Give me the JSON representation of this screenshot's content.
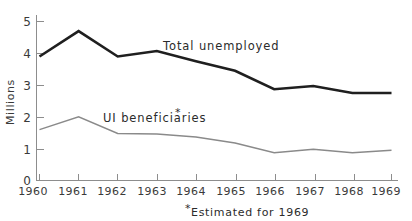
{
  "chart_data": {
    "type": "line",
    "title": "",
    "xlabel": "",
    "ylabel": "Millions",
    "categories": [
      "1960",
      "1961",
      "1962",
      "1963",
      "1964",
      "1965",
      "1966",
      "1967",
      "1968",
      "1969"
    ],
    "x": [
      1960,
      1961,
      1962,
      1963,
      1964,
      1965,
      1966,
      1967,
      1968,
      1969
    ],
    "xlim": [
      1960,
      1969
    ],
    "ylim": [
      0,
      5
    ],
    "yticks": [
      0,
      1,
      2,
      3,
      4,
      5
    ],
    "ytick_labels": [
      "0",
      "1",
      "2",
      "3",
      "4",
      "5"
    ],
    "grid": false,
    "legend_position": "inline-annotation",
    "series": [
      {
        "name": "Total unemployed",
        "color": "#1f1f1f",
        "line_width": 2.6,
        "values": [
          3.9,
          4.7,
          3.9,
          4.07,
          3.75,
          3.45,
          2.87,
          2.97,
          2.75,
          2.75
        ]
      },
      {
        "name": "UI beneficiaries*",
        "color": "#8a8a8a",
        "line_width": 1.5,
        "values": [
          1.6,
          2.0,
          1.48,
          1.46,
          1.37,
          1.18,
          0.87,
          0.98,
          0.87,
          0.95
        ]
      }
    ],
    "annotations": [
      {
        "text": "Total unemployed",
        "for_series": "Total unemployed"
      },
      {
        "text": "UI beneficiaries",
        "for_series": "UI beneficiaries*",
        "superscript": "*"
      }
    ],
    "footnote": "Estimated for 1969",
    "footnote_marker": "*"
  }
}
